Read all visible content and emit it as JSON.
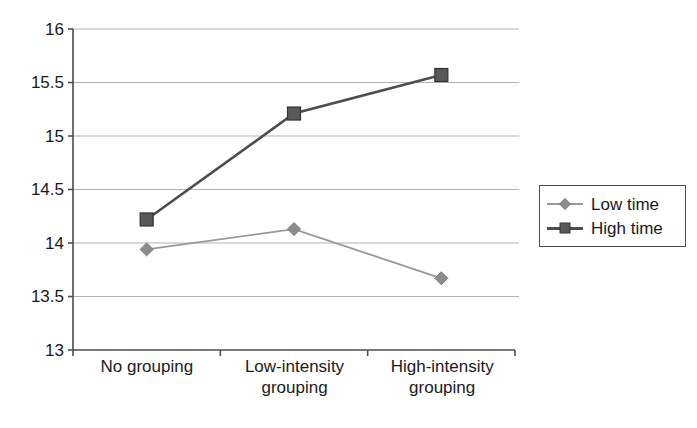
{
  "chart_data": {
    "type": "line",
    "title": "",
    "subtitle": "",
    "xlabel": "",
    "ylabel": "",
    "categories": [
      "No grouping",
      "Low-intensity grouping",
      "High-intensity grouping"
    ],
    "series": [
      {
        "name": "Low time",
        "values": [
          13.94,
          14.13,
          13.67
        ],
        "color": "#999999",
        "marker": "diamond",
        "marker_color": "#8c8c8c"
      },
      {
        "name": "High time",
        "values": [
          14.22,
          15.21,
          15.57
        ],
        "color": "#4d4d4d",
        "marker": "square",
        "marker_color": "#595959"
      }
    ],
    "ylim": [
      13,
      16
    ],
    "ytick_values": [
      13,
      13.5,
      14,
      14.5,
      15,
      15.5,
      16
    ],
    "ytick_labels": [
      "13",
      "13.5",
      "14",
      "14.5",
      "15",
      "15.5",
      "16"
    ],
    "grid": true,
    "grid_color": "#b3b3b3",
    "axis_color": "#4d4d4d",
    "legend_position": "right",
    "legend_entries": [
      "Low time",
      "High time"
    ],
    "background": "#ffffff"
  },
  "axes": {
    "y_labels": [
      "16",
      "15.5",
      "15",
      "14.5",
      "14",
      "13.5",
      "13"
    ],
    "x_labels": [
      "No grouping",
      "Low-intensity grouping",
      "High-intensity grouping"
    ]
  },
  "legend": {
    "items": [
      {
        "label": "Low time"
      },
      {
        "label": "High time"
      }
    ]
  }
}
